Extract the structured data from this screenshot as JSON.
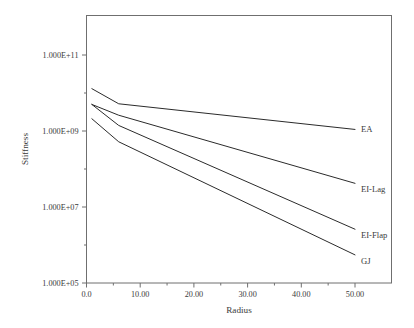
{
  "chart_data": {
    "type": "line",
    "title": "",
    "xlabel": "Radius",
    "ylabel": "Stiffness",
    "xlim": [
      0,
      50
    ],
    "ylim": [
      100000,
      1000000000000
    ],
    "yscale": "log",
    "grid": false,
    "legend_position": "right-of-line-ends",
    "x_tick_labels": [
      "0.0",
      "10.00",
      "20.00",
      "30.00",
      "40.00",
      "50.00"
    ],
    "x_tick_values": [
      0,
      10,
      20,
      30,
      40,
      50
    ],
    "y_tick_labels": [
      "1.000E+11",
      "1.000E+09",
      "1.000E+07",
      "1.000E+05"
    ],
    "y_tick_values": [
      100000000000,
      1000000000,
      10000000,
      100000
    ],
    "series": [
      {
        "name": "EA",
        "label": "EA",
        "x": [
          1.0,
          6.0,
          50.0
        ],
        "values": [
          13000000000.0,
          5200000000.0,
          1100000000.0
        ]
      },
      {
        "name": "EI-Lag",
        "label": "EI-Lag",
        "x": [
          1.0,
          6.0,
          50.0
        ],
        "values": [
          5000000000.0,
          2600000000.0,
          42000000.0
        ]
      },
      {
        "name": "EI-Flap",
        "label": "EI-Flap",
        "x": [
          1.0,
          6.0,
          50.0
        ],
        "values": [
          5000000000.0,
          1400000000.0,
          2600000.0
        ]
      },
      {
        "name": "GJ",
        "label": "GJ",
        "x": [
          1.0,
          6.0,
          50.0
        ],
        "values": [
          2100000000.0,
          520000000.0,
          550000.0
        ]
      }
    ]
  },
  "figure": {
    "background_color": "#ffffff",
    "line_color": "#2b2b2b",
    "axis_color": "#6f6f6f",
    "text_color": "#3a3a3a"
  }
}
